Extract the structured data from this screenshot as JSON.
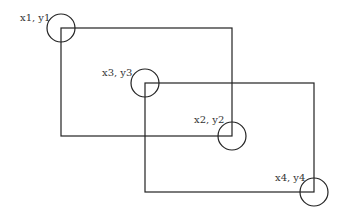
{
  "diagram": {
    "stroke_color": "#222222",
    "rectangles": [
      {
        "name": "rectangle-1",
        "x1": 61,
        "y1": 28,
        "x2": 232,
        "y2": 136
      },
      {
        "name": "rectangle-2",
        "x1": 145,
        "y1": 83,
        "x2": 314,
        "y2": 192
      }
    ],
    "points": [
      {
        "label": "x1, y1",
        "cx": 61,
        "cy": 28,
        "r": 14,
        "lx": 20,
        "ly": 21
      },
      {
        "label": "x3, y3",
        "cx": 145,
        "cy": 83,
        "r": 14,
        "lx": 102,
        "ly": 76
      },
      {
        "label": "x2, y2",
        "cx": 232,
        "cy": 136,
        "r": 14,
        "lx": 194,
        "ly": 123
      },
      {
        "label": "x4, y4",
        "cx": 314,
        "cy": 192,
        "r": 14,
        "lx": 275,
        "ly": 181
      }
    ]
  }
}
